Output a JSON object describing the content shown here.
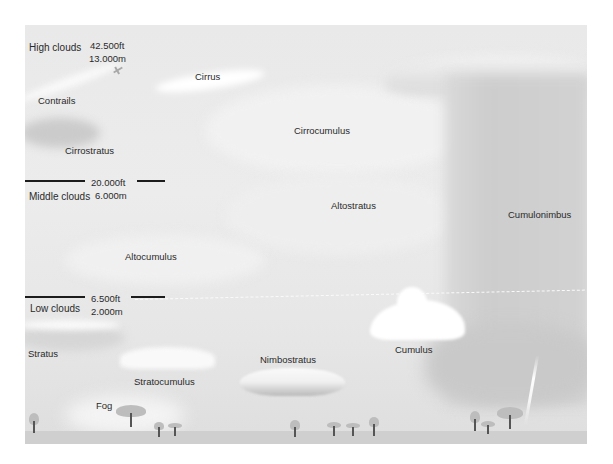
{
  "diagram": {
    "altitude_bands": [
      {
        "name": "High clouds",
        "ft": "42.500ft",
        "m": "13.000m"
      },
      {
        "name": "Middle clouds",
        "ft": "20.000ft",
        "m": "6.000m"
      },
      {
        "name": "Low clouds",
        "ft": "6.500ft",
        "m": "2.000m"
      }
    ],
    "clouds": {
      "cirrus": "Cirrus",
      "contrails": "Contrails",
      "cirrocumulus": "Cirrocumulus",
      "cirrostratus": "Cirrostratus",
      "altostratus": "Altostratus",
      "altocumulus": "Altocumulus",
      "cumulonimbus": "Cumulonimbus",
      "cumulus": "Cumulus",
      "nimbostratus": "Nimbostratus",
      "stratus": "Stratus",
      "stratocumulus": "Stratocumulus",
      "fog": "Fog"
    },
    "colors": {
      "sky": "#e9e9e9",
      "ground": "#cfcfcf",
      "rule": "#1c1c1c",
      "text": "#2a2a2a"
    }
  }
}
